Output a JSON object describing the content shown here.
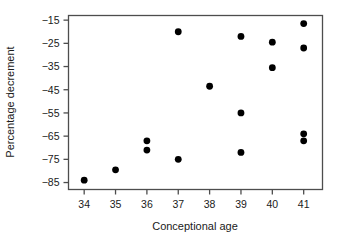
{
  "chart_data": {
    "type": "scatter",
    "title": "",
    "xlabel": "Conceptional age",
    "ylabel": "Percentage decrement",
    "xlim": [
      33.5,
      41.6
    ],
    "ylim": [
      -88,
      -13
    ],
    "grid": false,
    "legend": null,
    "xticks": [
      34,
      35,
      36,
      37,
      38,
      39,
      40,
      41
    ],
    "xtick_labels": [
      "34",
      "35",
      "36",
      "37",
      "38",
      "39",
      "40",
      "41"
    ],
    "yticks": [
      -15,
      -25,
      -35,
      -45,
      -55,
      -65,
      -75,
      -85
    ],
    "ytick_labels": [
      "-15",
      "-25",
      "-35",
      "-45",
      "-55",
      "-65",
      "-75",
      "-85"
    ],
    "marker": "filled-circle",
    "marker_color": "#000000",
    "marker_size": 3.4,
    "points": [
      {
        "x": 34,
        "y": -84
      },
      {
        "x": 35,
        "y": -79.5
      },
      {
        "x": 36,
        "y": -67
      },
      {
        "x": 36,
        "y": -71
      },
      {
        "x": 37,
        "y": -20
      },
      {
        "x": 37,
        "y": -75
      },
      {
        "x": 38,
        "y": -43.5
      },
      {
        "x": 39,
        "y": -22
      },
      {
        "x": 39,
        "y": -55
      },
      {
        "x": 39,
        "y": -72
      },
      {
        "x": 40,
        "y": -24.5
      },
      {
        "x": 40,
        "y": -35.5
      },
      {
        "x": 41,
        "y": -16.5
      },
      {
        "x": 41,
        "y": -27
      },
      {
        "x": 41,
        "y": -64
      },
      {
        "x": 41,
        "y": -67
      }
    ]
  },
  "colors": {
    "background": "#ffffff",
    "frame": "#4d4d4d",
    "text": "#1a1a1a",
    "marker": "#000000"
  }
}
